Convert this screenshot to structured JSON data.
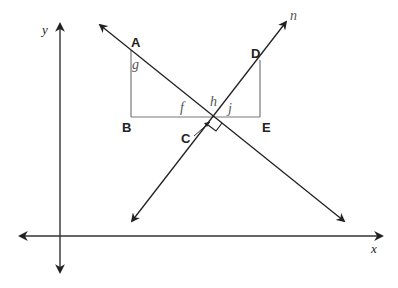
{
  "diagram": {
    "type": "coordinate-geometry",
    "axes": {
      "x_label": "x",
      "y_label": "y"
    },
    "lines": [
      {
        "name": "m",
        "label": "",
        "direction": "descending"
      },
      {
        "name": "n",
        "label": "n",
        "direction": "ascending"
      }
    ],
    "points": {
      "A": "A",
      "B": "B",
      "C": "C",
      "D": "D",
      "E": "E"
    },
    "angles": {
      "g": "g",
      "f": "f",
      "h": "h",
      "j": "j"
    },
    "annotations": {
      "right_angle_at": "C"
    },
    "colors": {
      "line": "#222222",
      "triangle": "#777777",
      "angle_label": "#555555"
    }
  }
}
